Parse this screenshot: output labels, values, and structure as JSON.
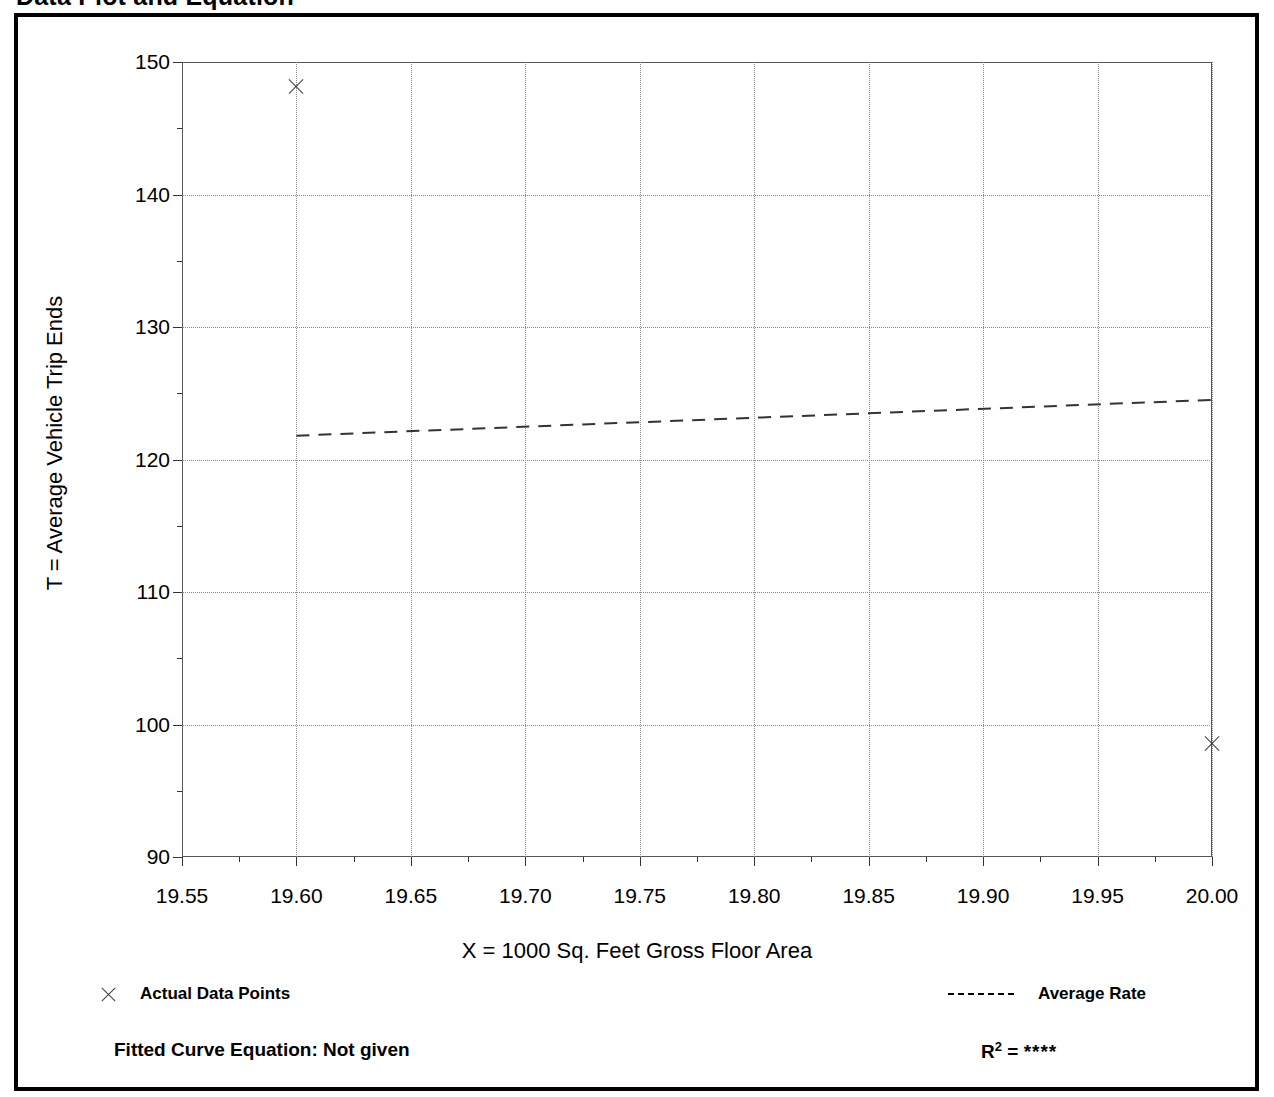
{
  "page": {
    "title": "Data Plot and Equation"
  },
  "chart_data": {
    "type": "scatter",
    "title": "Data Plot and Equation",
    "xlabel": "X = 1000 Sq. Feet Gross Floor Area",
    "ylabel": "T = Average Vehicle Trip Ends",
    "xlim": [
      19.55,
      20.0
    ],
    "ylim": [
      90,
      150
    ],
    "xticks": [
      "19.55",
      "19.60",
      "19.65",
      "19.70",
      "19.75",
      "19.80",
      "19.85",
      "19.90",
      "19.95",
      "20.00"
    ],
    "xtick_values": [
      19.55,
      19.6,
      19.65,
      19.7,
      19.75,
      19.8,
      19.85,
      19.9,
      19.95,
      20.0
    ],
    "yticks": [
      "150",
      "140",
      "130",
      "120",
      "110",
      "100",
      "90"
    ],
    "ytick_values": [
      150,
      140,
      130,
      120,
      110,
      100,
      90
    ],
    "grid": "dotted-both-axes",
    "minor_ticks": true,
    "legend_position": "below-plot",
    "series": [
      {
        "name": "Actual Data Points",
        "type": "scatter",
        "marker": "x",
        "points": [
          {
            "x": 19.6,
            "y": 148.1
          },
          {
            "x": 20.0,
            "y": 98.5
          }
        ]
      },
      {
        "name": "Average Rate",
        "type": "line",
        "style": "dashed",
        "points": [
          {
            "x": 19.6,
            "y": 121.8
          },
          {
            "x": 20.0,
            "y": 124.5
          }
        ]
      }
    ]
  },
  "legend": {
    "data_points_label": "Actual Data Points",
    "average_rate_label": "Average Rate"
  },
  "footer": {
    "fitted_curve_label": "Fitted Curve Equation:  Not given",
    "r2_label": "R",
    "r2_exponent": "2",
    "r2_equals": " = ",
    "r2_value": "****"
  },
  "colors": {
    "ink": "#000000",
    "grid": "#8a8a8a",
    "marker": "#3b3b3b",
    "frame": "#555555"
  }
}
